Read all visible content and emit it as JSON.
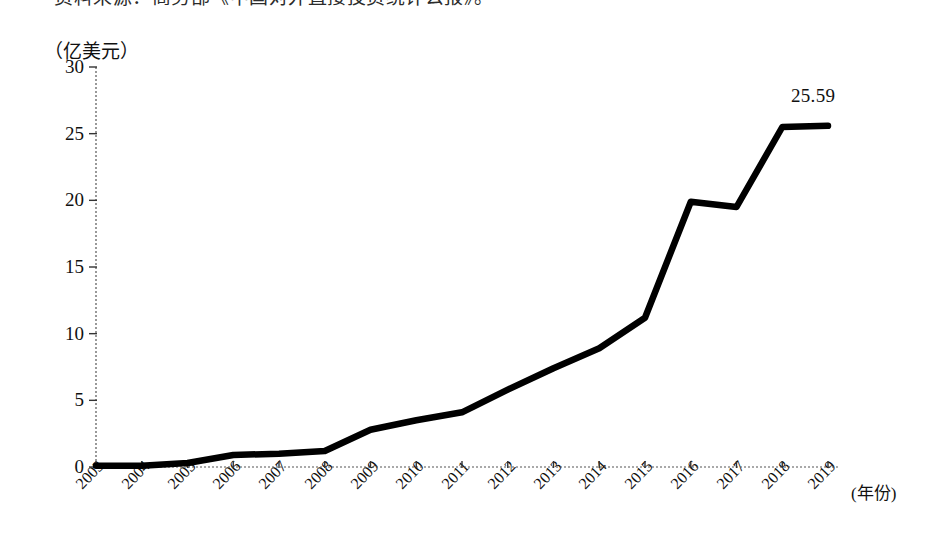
{
  "source_note": "资料来源：商务部《中国对外直接投资统计公报》。",
  "axis": {
    "y_title": "（亿美元）",
    "x_title": "(年份)"
  },
  "chart_data": {
    "type": "line",
    "title": "",
    "xlabel": "(年份)",
    "ylabel": "（亿美元）",
    "categories": [
      "2003",
      "2004",
      "2005",
      "2006",
      "2007",
      "2008",
      "2009",
      "2010",
      "2011",
      "2012",
      "2013",
      "2014",
      "2015",
      "2016",
      "2017",
      "2018",
      "2019"
    ],
    "values": [
      0.1,
      0.1,
      0.3,
      0.9,
      1.0,
      1.2,
      2.8,
      3.5,
      4.1,
      5.8,
      7.4,
      8.9,
      11.2,
      19.9,
      19.5,
      25.5,
      25.59
    ],
    "ylim": [
      0,
      30
    ],
    "yticks": [
      0,
      5,
      10,
      15,
      20,
      25,
      30
    ],
    "grid": false,
    "legend": "none",
    "series_color": "#000000",
    "annotations": [
      {
        "text": "25.59",
        "x": "2019",
        "y": 25.59
      }
    ]
  }
}
